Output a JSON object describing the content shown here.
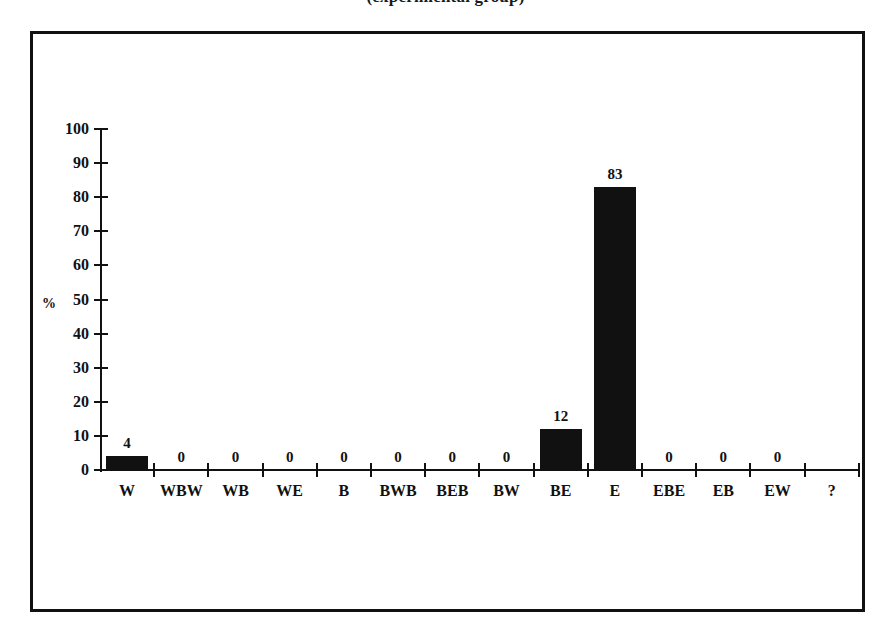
{
  "figure": {
    "title_clipped": "(experimental group)"
  },
  "chart_data": {
    "type": "bar",
    "title": "(experimental group)",
    "xlabel": "",
    "ylabel": "%",
    "ylim": [
      0,
      100
    ],
    "ytick_step": 10,
    "ytick_labels": [
      "100",
      "90",
      "80",
      "70",
      "60",
      "50",
      "40",
      "30",
      "20",
      "10",
      "0"
    ],
    "grid": false,
    "legend": false,
    "bar_color": "#111111",
    "categories": [
      "W",
      "WBW",
      "WB",
      "WE",
      "B",
      "BWB",
      "BEB",
      "BW",
      "BE",
      "E",
      "EBE",
      "EB",
      "EW",
      "?"
    ],
    "values": [
      4,
      0,
      0,
      0,
      0,
      0,
      0,
      0,
      12,
      83,
      0,
      0,
      0,
      null
    ],
    "value_labels": [
      "4",
      "0",
      "0",
      "0",
      "0",
      "0",
      "0",
      "0",
      "12",
      "83",
      "0",
      "0",
      "0",
      ""
    ]
  }
}
